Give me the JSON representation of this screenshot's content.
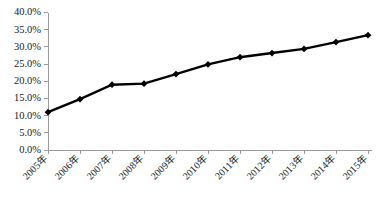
{
  "chart_data": {
    "type": "line",
    "title": "",
    "subtitle": "",
    "xlabel": "",
    "ylabel": "",
    "categories": [
      "2005年",
      "2006年",
      "2007年",
      "2008年",
      "2009年",
      "2010年",
      "2011年",
      "2012年",
      "2013年",
      "2014年",
      "2015年"
    ],
    "values": [
      11.0,
      14.8,
      19.0,
      19.3,
      22.1,
      24.9,
      27.0,
      28.2,
      29.4,
      31.4,
      33.4
    ],
    "value_unit": "%",
    "ylim": [
      0.0,
      40.0
    ],
    "ytick_step": 5.0,
    "ytick_labels": [
      "0.0%",
      "5.0%",
      "10.0%",
      "15.0%",
      "20.0%",
      "25.0%",
      "30.0%",
      "35.0%",
      "40.0%"
    ],
    "ytick_values": [
      0.0,
      5.0,
      10.0,
      15.0,
      20.0,
      25.0,
      30.0,
      35.0,
      40.0
    ],
    "grid": false,
    "legend": false,
    "legend_position": "none",
    "marker": "diamond",
    "series_color": "#000000",
    "axis_color": "#9a9a9a",
    "background_color": "#ffffff",
    "xtick_label_rotation": -45
  }
}
